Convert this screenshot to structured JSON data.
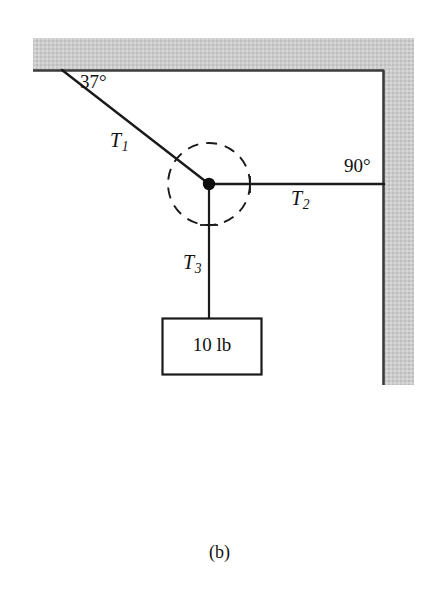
{
  "figure": {
    "caption": "(b)",
    "background_color": "#ffffff",
    "line_color": "#1a1a1a",
    "wall_fill_color": "#c9c9c9",
    "wall_edge_color": "#3b3b3b"
  },
  "labels": {
    "angle_ceiling": "37°",
    "angle_wall": "90°",
    "tension_1": "T",
    "tension_1_sub": "1",
    "tension_2": "T",
    "tension_2_sub": "2",
    "tension_3": "T",
    "tension_3_sub": "3",
    "weight": "10 lb"
  },
  "geometry": {
    "knot_x": 209,
    "knot_y": 184,
    "ceiling_anchor_x": 62,
    "ceiling_anchor_y": 70,
    "wall_anchor_x": 383,
    "wall_anchor_y": 184,
    "block_top_x": 209,
    "block_top_y": 318,
    "dashed_circle_radius": 41,
    "block_left": 162,
    "block_top": 318,
    "block_width": 100,
    "block_height": 57
  },
  "elements": {
    "ceiling_name": "ceiling-hatched-band",
    "wall_name": "wall-hatched-band",
    "rope_t1_name": "rope-t1",
    "rope_t2_name": "rope-t2",
    "rope_t3_name": "rope-t3",
    "knot_name": "knot-point",
    "circle_name": "free-body-dashed-circle",
    "block_name": "hanging-weight-block"
  }
}
